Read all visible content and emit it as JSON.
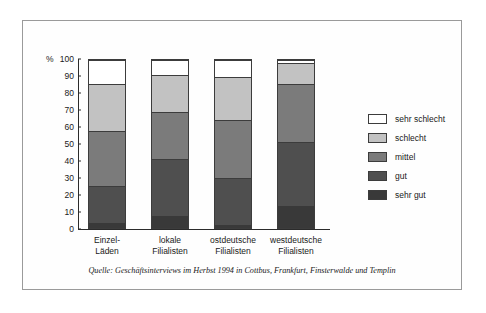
{
  "chart_data": {
    "type": "bar",
    "subtype": "stacked-percent",
    "title": "",
    "subtitle": "",
    "xlabel": "",
    "ylabel": "%",
    "ylim": [
      0,
      100
    ],
    "yticks": [
      0,
      10,
      20,
      30,
      40,
      50,
      60,
      70,
      80,
      90,
      100
    ],
    "grid": false,
    "legend_position": "right",
    "categories": [
      "Einzel-\nLäden",
      "lokale\nFilialisten",
      "ostdeutsche\nFilialisten",
      "westdeutsche\nFilialisten"
    ],
    "category_lines": [
      [
        "Einzel-",
        "Läden"
      ],
      [
        "lokale",
        "Filialisten"
      ],
      [
        "ostdeutsche",
        "Filialisten"
      ],
      [
        "westdeutsche",
        "Filialisten"
      ]
    ],
    "series": [
      {
        "name": "sehr gut",
        "color": "#393939",
        "values": [
          3,
          7,
          2,
          13
        ]
      },
      {
        "name": "gut",
        "color": "#4f4f4f",
        "values": [
          22,
          34,
          28,
          38
        ]
      },
      {
        "name": "mittel",
        "color": "#7b7b7b",
        "values": [
          33,
          28,
          34,
          35
        ]
      },
      {
        "name": "schlecht",
        "color": "#c2c2c2",
        "values": [
          28,
          22,
          26,
          12
        ]
      },
      {
        "name": "sehr schlecht",
        "color": "#ffffff",
        "values": [
          14,
          9,
          10,
          2
        ]
      }
    ],
    "cumulative_tops": [
      [
        3,
        25,
        58,
        86,
        100
      ],
      [
        7,
        41,
        69,
        91,
        100
      ],
      [
        2,
        30,
        64,
        90,
        100
      ],
      [
        13,
        51,
        86,
        98,
        100
      ]
    ],
    "source_note": "Quelle: Geschäftsinterviews im Herbst 1994 in Cottbus, Frankfurt, Finsterwalde und Templin"
  },
  "legend": {
    "items": [
      {
        "label": "sehr schlecht",
        "color": "#ffffff"
      },
      {
        "label": "schlecht",
        "color": "#c2c2c2"
      },
      {
        "label": "mittel",
        "color": "#7b7b7b"
      },
      {
        "label": "gut",
        "color": "#4f4f4f"
      },
      {
        "label": "sehr gut",
        "color": "#393939"
      }
    ]
  },
  "axis": {
    "unit_label": "%",
    "tick_labels": [
      "100",
      "90",
      "80",
      "70",
      "60",
      "50",
      "40",
      "30",
      "20",
      "10",
      "0"
    ]
  },
  "colors": {
    "frame": "#9a9a9a",
    "axis": "#2b2b2b",
    "text": "#1a1a1a",
    "background": "#ffffff"
  }
}
